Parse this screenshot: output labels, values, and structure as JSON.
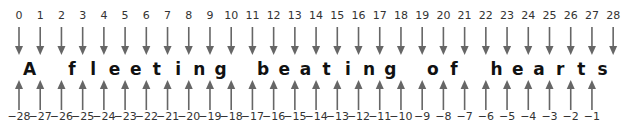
{
  "diagram": {
    "text": "A fleeting beating of hearts",
    "characters": [
      "A",
      " ",
      "f",
      "l",
      "e",
      "e",
      "t",
      "i",
      "n",
      "g",
      " ",
      "b",
      "e",
      "a",
      "t",
      "i",
      "n",
      "g",
      " ",
      "o",
      "f",
      " ",
      "h",
      "e",
      "a",
      "r",
      "t",
      "s"
    ],
    "positive_indices": [
      "0",
      "1",
      "2",
      "3",
      "4",
      "5",
      "6",
      "7",
      "8",
      "9",
      "10",
      "11",
      "12",
      "13",
      "14",
      "15",
      "16",
      "17",
      "18",
      "19",
      "20",
      "21",
      "22",
      "23",
      "24",
      "25",
      "26",
      "27",
      "28"
    ],
    "negative_indices": [
      "−28",
      "−27",
      "−26",
      "−25",
      "−24",
      "−23",
      "−22",
      "−21",
      "−20",
      "−19",
      "−18",
      "−17",
      "−16",
      "−15",
      "−14",
      "−13",
      "−12",
      "−11",
      "−10",
      "−9",
      "−8",
      "−7",
      "−6",
      "−5",
      "−4",
      "−3",
      "−2",
      "−1"
    ],
    "arrow_color": "#666666"
  }
}
